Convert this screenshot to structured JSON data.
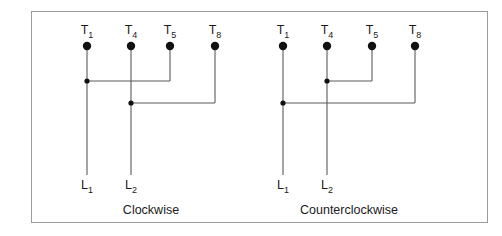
{
  "figure": {
    "title": "",
    "border_color": "#9b9b9b",
    "wire_color": "#5a5a5a",
    "dot_color": "#111111",
    "background": "#ffffff"
  },
  "diagrams": [
    {
      "id": "clockwise",
      "caption": "Clockwise",
      "caption_x": 151,
      "caption_y": 203,
      "terminals": [
        {
          "label": "T",
          "sub": "1",
          "x": 87
        },
        {
          "label": "T",
          "sub": "4",
          "x": 131
        },
        {
          "label": "T",
          "sub": "5",
          "x": 170
        },
        {
          "label": "T",
          "sub": "8",
          "x": 215
        }
      ],
      "leads": [
        {
          "label": "L",
          "sub": "1",
          "x": 87
        },
        {
          "label": "L",
          "sub": "2",
          "x": 131
        }
      ],
      "connections": [
        {
          "name": "upper-wire",
          "from": "T1",
          "to": "T5",
          "junction_x": 87,
          "y": 81
        },
        {
          "name": "lower-wire",
          "from": "T4",
          "to": "T8",
          "junction_x": 131,
          "y": 103
        }
      ]
    },
    {
      "id": "counterclockwise",
      "caption": "Counterclockwise",
      "caption_x": 349,
      "caption_y": 203,
      "terminals": [
        {
          "label": "T",
          "sub": "1",
          "x": 283
        },
        {
          "label": "T",
          "sub": "4",
          "x": 327
        },
        {
          "label": "T",
          "sub": "5",
          "x": 372
        },
        {
          "label": "T",
          "sub": "8",
          "x": 415
        }
      ],
      "leads": [
        {
          "label": "L",
          "sub": "1",
          "x": 283
        },
        {
          "label": "L",
          "sub": "2",
          "x": 327
        }
      ],
      "connections": [
        {
          "name": "upper-wire",
          "from": "T4",
          "to": "T5",
          "junction_x": 327,
          "y": 81
        },
        {
          "name": "lower-wire",
          "from": "T1",
          "to": "T8",
          "junction_x": 283,
          "y": 103
        }
      ]
    }
  ],
  "geometry": {
    "terminal_dot_y": 46,
    "terminal_dot_r": 4.2,
    "junction_dot_r": 2.6,
    "terminal_label_y": 23,
    "lead_label_y": 178,
    "lead_end_y": 175
  }
}
